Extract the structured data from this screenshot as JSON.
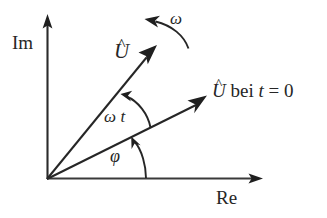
{
  "figure": {
    "background_color": "#ffffff",
    "stroke_color": "#262626",
    "width": 327,
    "height": 218
  },
  "axes": {
    "origin": {
      "x": 47,
      "y": 179
    },
    "imaginary": {
      "label": "Im",
      "tip": {
        "x": 48,
        "y": 17
      }
    },
    "real": {
      "label": "Re",
      "tip": {
        "x": 262,
        "y": 179
      }
    }
  },
  "vectors": [
    {
      "id": "u-hat-rotating",
      "label": "U",
      "accent": "^",
      "angle_deg": 48,
      "tip": {
        "x": 156,
        "y": 46
      }
    },
    {
      "id": "u-hat-t0",
      "label_var": "U",
      "accent": "^",
      "label_rest": "bei",
      "label_time_var": "t",
      "label_equals": "=",
      "label_time_value": "0",
      "angle_deg": 28,
      "tip": {
        "x": 206,
        "y": 96
      }
    }
  ],
  "annotations": {
    "omega": {
      "symbol": "ω",
      "meaning": "angular-velocity",
      "arrow": "curved-counterclockwise"
    },
    "omega_t": {
      "symbol_omega": "ω",
      "symbol_t": "t",
      "meaning": "rotation-angle-since-t0",
      "arc": "between-t0-vector-and-rotating-vector"
    },
    "phi": {
      "symbol": "φ",
      "meaning": "initial-phase-angle",
      "arc": "between-real-axis-and-t0-vector"
    }
  }
}
